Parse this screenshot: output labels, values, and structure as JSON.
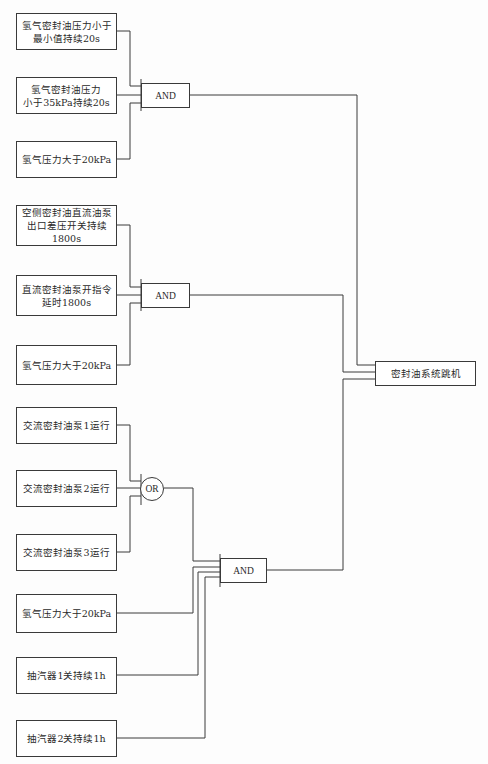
{
  "diagram": {
    "title": "",
    "inputs": [
      {
        "id": "in1",
        "label": "氢气密封油压力小于\n最小值持续20s"
      },
      {
        "id": "in2",
        "label": "氢气密封油压力\n小于35kPa持续20s"
      },
      {
        "id": "in3",
        "label": "氢气压力大于20kPa"
      },
      {
        "id": "in4",
        "label": "空侧密封油直流油泵\n出口差压开关持续\n1800s"
      },
      {
        "id": "in5",
        "label": "直流密封油泵开指令\n延时1800s"
      },
      {
        "id": "in6",
        "label": "氢气压力大于20kPa"
      },
      {
        "id": "in7",
        "label": "交流密封油泵1运行"
      },
      {
        "id": "in8",
        "label": "交流密封油泵2运行"
      },
      {
        "id": "in9",
        "label": "交流密封油泵3运行"
      },
      {
        "id": "in10",
        "label": "氢气压力大于20kPa"
      },
      {
        "id": "in11",
        "label": "抽汽器1关持续1h"
      },
      {
        "id": "in12",
        "label": "抽汽器2关持续1h"
      }
    ],
    "gates": [
      {
        "id": "and1",
        "type": "AND",
        "label": "AND",
        "inputs": [
          "in1",
          "in2",
          "in3"
        ]
      },
      {
        "id": "and2",
        "type": "AND",
        "label": "AND",
        "inputs": [
          "in4",
          "in5",
          "in6"
        ]
      },
      {
        "id": "or1",
        "type": "OR",
        "label": "OR",
        "inputs": [
          "in7",
          "in8",
          "in9"
        ]
      },
      {
        "id": "and3",
        "type": "AND",
        "label": "AND",
        "inputs": [
          "or1",
          "in10",
          "in11",
          "in12"
        ]
      }
    ],
    "output": {
      "id": "out",
      "label": "密封油系统跳机",
      "inputs": [
        "and1",
        "and2",
        "and3"
      ]
    },
    "colors": {
      "line": "#3a3a3a",
      "box_border": "#3a3a3a",
      "background": "#fdfdfd"
    }
  }
}
